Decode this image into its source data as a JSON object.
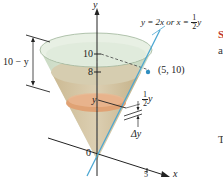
{
  "figure": {
    "equation_prefix": "y = 2x or x = ",
    "equation_frac_num": "1",
    "equation_frac_den": "2",
    "equation_suffix": "y",
    "point_label": "(5, 10)",
    "axis_y_label": "y",
    "axis_x_label": "x",
    "tick_10": "10",
    "tick_8": "8",
    "tick_5": "5",
    "origin_label": "0",
    "height_label": "10 − y",
    "slice_y_label": "y",
    "radius_frac_num": "1",
    "radius_frac_den": "2",
    "radius_suffix": "y",
    "delta_y_label": "Δy"
  },
  "side_text": {
    "fragment_1": "S",
    "fragment_2": "a",
    "fragment_3": "T"
  },
  "colors": {
    "cone_top": "#d9e6d4",
    "water": "#d7c9a9",
    "slice": "#e2a276",
    "line_blue": "#4aa6d2",
    "accent_red": "#c0392b",
    "ink": "#222222"
  }
}
